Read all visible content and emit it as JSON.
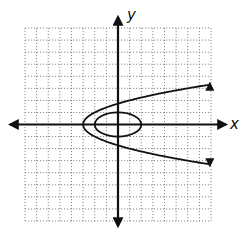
{
  "chart_data": {
    "type": "line",
    "title": "",
    "xlabel": "x",
    "ylabel": "y",
    "xlim": [
      -8,
      8
    ],
    "ylim": [
      -8,
      8
    ],
    "grid": true,
    "grid_style": "dotted",
    "grid_step": 1,
    "tick_labels": false,
    "legend": null,
    "series": [
      {
        "name": "parabola",
        "equation": "x = y^2 - 3",
        "vertex": [
          -3,
          0
        ],
        "opens": "right",
        "arrows": true,
        "points": [
          [
            7.9,
            3.4
          ],
          [
            3.25,
            2.5
          ],
          [
            1,
            2
          ],
          [
            0,
            1.73
          ],
          [
            -2,
            1
          ],
          [
            -3,
            0
          ],
          [
            -2,
            -1
          ],
          [
            0,
            -1.73
          ],
          [
            1,
            -2
          ],
          [
            3.25,
            -2.5
          ],
          [
            7.9,
            -3.4
          ]
        ]
      },
      {
        "name": "ellipse",
        "equation": "x^2/4 + y^2 = 1",
        "center": [
          0,
          0
        ],
        "semi_axis_x": 2,
        "semi_axis_y": 1
      }
    ]
  },
  "labels": {
    "x_axis": "x",
    "y_axis": "y"
  },
  "colors": {
    "ink": "#111111",
    "grid": "#8a8a8a",
    "background": "#ffffff"
  }
}
